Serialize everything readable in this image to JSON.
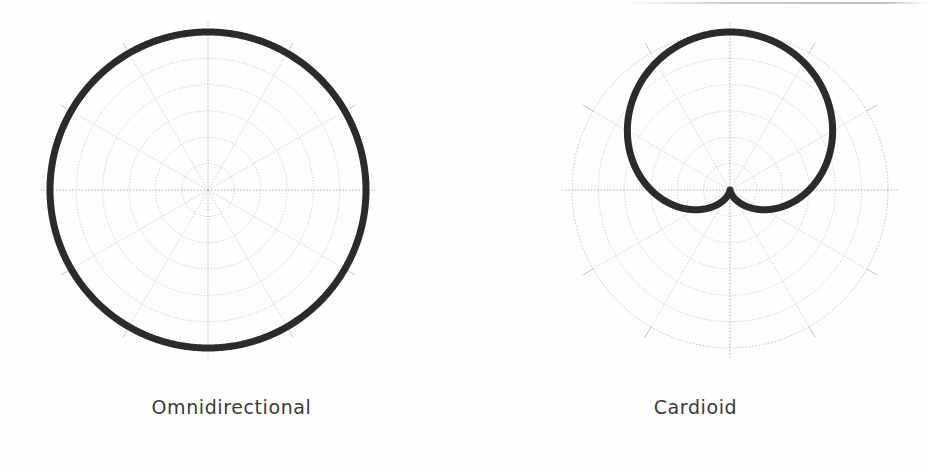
{
  "figure": {
    "background_color": "#fefefe",
    "panel_count": 2
  },
  "panels": [
    {
      "caption": "Omnidirectional",
      "pattern": "omnidirectional",
      "center_x": 208,
      "center_y": 190,
      "outer_radius": 158,
      "curve_color": "#2b2b2b",
      "curve_width": 7,
      "grid_color": "#b9b9b9",
      "axis_color": "#a8a8a8",
      "rings": 6,
      "spokes": 12,
      "spoke_step_deg": 30,
      "tick_marks": 8
    },
    {
      "caption": "Cardioid",
      "pattern": "cardioid",
      "center_x": 266,
      "center_y": 190,
      "outer_radius": 158,
      "curve_color": "#2b2b2b",
      "curve_width": 7,
      "grid_color": "#b9b9b9",
      "axis_color": "#a8a8a8",
      "rings": 6,
      "spokes": 12,
      "spoke_step_deg": 30,
      "tick_marks": 8
    }
  ],
  "chart_data": [
    {
      "type": "line",
      "subtype": "polar",
      "title": "Omnidirectional",
      "xlabel": "",
      "ylabel": "",
      "grid": true,
      "legend": "none",
      "theta_unit": "degrees",
      "theta_zero_at": "top",
      "r_range": [
        0,
        1
      ],
      "r_gridlines": [
        0.1667,
        0.3333,
        0.5,
        0.6667,
        0.8333,
        1.0
      ],
      "theta_gridlines": [
        0,
        30,
        60,
        90,
        120,
        150,
        180,
        210,
        240,
        270,
        300,
        330
      ],
      "equation": "r = 1",
      "theta": [
        0,
        15,
        30,
        45,
        60,
        75,
        90,
        105,
        120,
        135,
        150,
        165,
        180,
        195,
        210,
        225,
        240,
        255,
        270,
        285,
        300,
        315,
        330,
        345,
        360
      ],
      "r": [
        1,
        1,
        1,
        1,
        1,
        1,
        1,
        1,
        1,
        1,
        1,
        1,
        1,
        1,
        1,
        1,
        1,
        1,
        1,
        1,
        1,
        1,
        1,
        1,
        1
      ]
    },
    {
      "type": "line",
      "subtype": "polar",
      "title": "Cardioid",
      "xlabel": "",
      "ylabel": "",
      "grid": true,
      "legend": "none",
      "theta_unit": "degrees",
      "theta_zero_at": "top",
      "r_range": [
        0,
        1
      ],
      "r_gridlines": [
        0.1667,
        0.3333,
        0.5,
        0.6667,
        0.8333,
        1.0
      ],
      "theta_gridlines": [
        0,
        30,
        60,
        90,
        120,
        150,
        180,
        210,
        240,
        270,
        300,
        330
      ],
      "equation": "r = 0.5 (1 + cos θ)",
      "theta": [
        0,
        15,
        30,
        45,
        60,
        75,
        90,
        105,
        120,
        135,
        150,
        165,
        180,
        195,
        210,
        225,
        240,
        255,
        270,
        285,
        300,
        315,
        330,
        345,
        360
      ],
      "r": [
        1.0,
        0.983,
        0.933,
        0.854,
        0.75,
        0.629,
        0.5,
        0.371,
        0.25,
        0.146,
        0.067,
        0.017,
        0.0,
        0.017,
        0.067,
        0.146,
        0.25,
        0.371,
        0.5,
        0.629,
        0.75,
        0.854,
        0.933,
        0.983,
        1.0
      ]
    }
  ]
}
